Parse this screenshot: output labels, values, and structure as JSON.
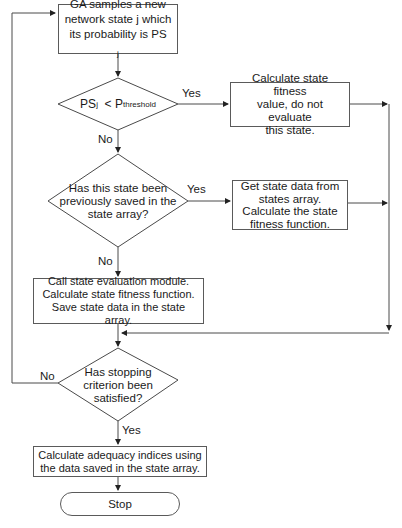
{
  "diagram": {
    "type": "flowchart",
    "nodes": {
      "sample": {
        "text": "GA samples a new network state j which its probability is PS",
        "subscript": "j"
      },
      "threshold_decision": {
        "left": "PS",
        "left_sub": "j",
        "op": "<",
        "right": "P",
        "right_sub": "threshold"
      },
      "skip_eval": {
        "text": "Calculate state fitness\nvalue, do not evaluate\nthis state."
      },
      "saved_decision": {
        "text": "Has this state been\npreviously saved in the\nstate array?"
      },
      "get_saved": {
        "text": "Get state data from\nstates array.\nCalculate the state\nfitness function."
      },
      "evaluate": {
        "text": "Call  state evaluation module.\nCalculate state fitness function.\nSave state data in the state array."
      },
      "stop_decision": {
        "text": "Has stopping\ncriterion been\nsatisfied?"
      },
      "adequacy": {
        "text": "Calculate adequacy indices using\nthe data saved in the state array."
      },
      "stop": {
        "text": "Stop"
      }
    },
    "edge_labels": {
      "threshold_yes": "Yes",
      "threshold_no": "No",
      "saved_yes": "Yes",
      "saved_no": "No",
      "stop_no": "No",
      "stop_yes": "Yes"
    },
    "colors": {
      "line": "#4a4a4a",
      "border": "#5a5a5a",
      "text": "#1a1a1a",
      "background": "#ffffff"
    }
  }
}
